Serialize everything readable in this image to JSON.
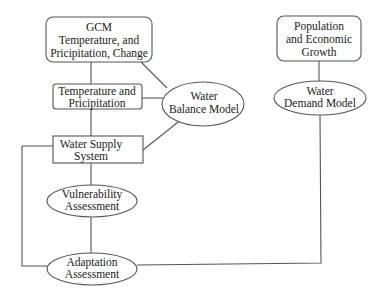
{
  "diagram": {
    "type": "flowchart",
    "nodes": {
      "gcm": {
        "shape": "rounded-rect",
        "lines": [
          "GCM",
          "Temperature, and",
          "Pricipitation, Change"
        ]
      },
      "temp_precip": {
        "shape": "rect",
        "lines": [
          "Temperature and",
          "Pricipitation"
        ]
      },
      "water_balance": {
        "shape": "ellipse",
        "lines": [
          "Water",
          "Balance Model"
        ]
      },
      "water_supply": {
        "shape": "rect",
        "lines": [
          "Water Supply",
          "System"
        ]
      },
      "vulnerability": {
        "shape": "ellipse",
        "lines": [
          "Vulnerability",
          "Assessment"
        ]
      },
      "adaptation": {
        "shape": "ellipse",
        "lines": [
          "Adaptation",
          "Assessment"
        ]
      },
      "population": {
        "shape": "rounded-rect",
        "lines": [
          "Population",
          "and Economic",
          "Growth"
        ]
      },
      "water_demand": {
        "shape": "ellipse",
        "lines": [
          "Water",
          "Demand Model"
        ]
      }
    },
    "edges": [
      [
        "gcm",
        "temp_precip"
      ],
      [
        "gcm",
        "water_balance"
      ],
      [
        "temp_precip",
        "water_balance"
      ],
      [
        "temp_precip",
        "water_supply"
      ],
      [
        "water_balance",
        "water_supply"
      ],
      [
        "water_supply",
        "vulnerability"
      ],
      [
        "vulnerability",
        "adaptation"
      ],
      [
        "adaptation",
        "water_supply"
      ],
      [
        "population",
        "water_demand"
      ],
      [
        "water_demand",
        "adaptation"
      ]
    ],
    "colors": {
      "stroke": "#555555",
      "text": "#1a1a1a",
      "background": "#ffffff"
    }
  }
}
